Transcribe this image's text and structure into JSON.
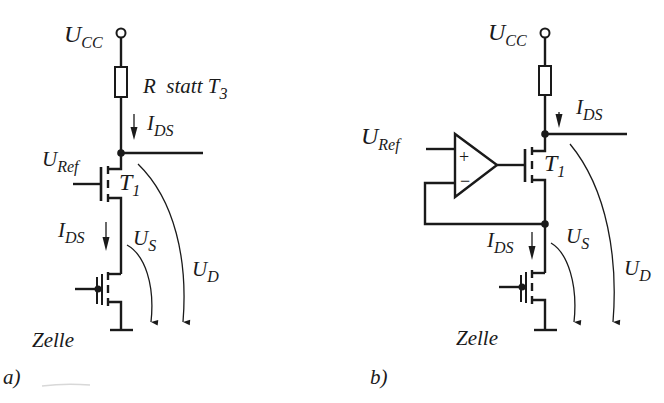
{
  "diagrams": [
    {
      "id": "a",
      "caption": "a)",
      "supply": {
        "main": "U",
        "sub": "CC"
      },
      "resistor_label": {
        "text": "R  statt T",
        "sub": "3"
      },
      "current_top": {
        "main": "I",
        "sub": "DS"
      },
      "reference": {
        "main": "U",
        "sub": "Ref"
      },
      "transistor": {
        "main": "T",
        "sub": "1"
      },
      "current_bottom": {
        "main": "I",
        "sub": "DS"
      },
      "voltage_source": {
        "main": "U",
        "sub": "S"
      },
      "voltage_drain": {
        "main": "U",
        "sub": "D"
      },
      "cell_label": "Zelle"
    },
    {
      "id": "b",
      "caption": "b)",
      "supply": {
        "main": "U",
        "sub": "CC"
      },
      "current_top": {
        "main": "I",
        "sub": "DS"
      },
      "reference": {
        "main": "U",
        "sub": "Ref"
      },
      "opamp": {
        "plus": "+",
        "minus": "−"
      },
      "transistor": {
        "main": "T",
        "sub": "1"
      },
      "current_bottom": {
        "main": "I",
        "sub": "DS"
      },
      "voltage_source": {
        "main": "U",
        "sub": "S"
      },
      "voltage_drain": {
        "main": "U",
        "sub": "D"
      },
      "cell_label": "Zelle"
    }
  ]
}
